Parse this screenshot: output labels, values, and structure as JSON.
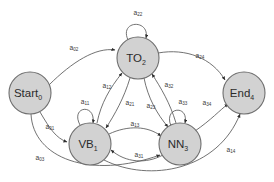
{
  "diagram": {
    "type": "state-transition-diagram",
    "title": "",
    "background_color": "#ffffff",
    "node_fill_color": "#d2d2d2",
    "node_stroke_color": "#6e6e6e",
    "edge_color": "#585858",
    "label_color": "#3a3a3a",
    "nodes": [
      {
        "id": "start",
        "base": "Start",
        "subscript": "0",
        "cx": 30,
        "cy": 93,
        "r": 21
      },
      {
        "id": "to",
        "base": "TO",
        "subscript": "2",
        "cx": 138,
        "cy": 58,
        "r": 21
      },
      {
        "id": "vb",
        "base": "VB",
        "subscript": "1",
        "cx": 90,
        "cy": 144,
        "r": 21
      },
      {
        "id": "nn",
        "base": "NN",
        "subscript": "3",
        "cx": 180,
        "cy": 144,
        "r": 21
      },
      {
        "id": "end",
        "base": "End",
        "subscript": "4",
        "cx": 244,
        "cy": 93,
        "r": 21
      }
    ],
    "edges": [
      {
        "id": "a02",
        "base": "a",
        "subscript": "02",
        "from": "start",
        "to": "to",
        "label_x": 74,
        "label_y": 48
      },
      {
        "id": "a01",
        "base": "a",
        "subscript": "01",
        "from": "start",
        "to": "vb",
        "label_x": 50,
        "label_y": 127
      },
      {
        "id": "a03",
        "base": "a",
        "subscript": "03",
        "from": "start",
        "to": "nn",
        "label_x": 40,
        "label_y": 158
      },
      {
        "id": "a11",
        "base": "a",
        "subscript": "11",
        "from": "vb",
        "to": "vb",
        "label_x": 85,
        "label_y": 102
      },
      {
        "id": "a22",
        "base": "a",
        "subscript": "22",
        "from": "to",
        "to": "to",
        "label_x": 138,
        "label_y": 13
      },
      {
        "id": "a33",
        "base": "a",
        "subscript": "33",
        "from": "nn",
        "to": "nn",
        "label_x": 183,
        "label_y": 102
      },
      {
        "id": "a12",
        "base": "a",
        "subscript": "12",
        "from": "vb",
        "to": "to",
        "label_x": 107,
        "label_y": 86
      },
      {
        "id": "a21",
        "base": "a",
        "subscript": "21",
        "from": "to",
        "to": "vb",
        "label_x": 130,
        "label_y": 103
      },
      {
        "id": "a23",
        "base": "a",
        "subscript": "23",
        "from": "to",
        "to": "nn",
        "label_x": 151,
        "label_y": 106
      },
      {
        "id": "a32",
        "base": "a",
        "subscript": "32",
        "from": "nn",
        "to": "to",
        "label_x": 169,
        "label_y": 85
      },
      {
        "id": "a13",
        "base": "a",
        "subscript": "13",
        "from": "vb",
        "to": "nn",
        "label_x": 135,
        "label_y": 124
      },
      {
        "id": "a31",
        "base": "a",
        "subscript": "31",
        "from": "nn",
        "to": "vb",
        "label_x": 139,
        "label_y": 155
      },
      {
        "id": "a24",
        "base": "a",
        "subscript": "24",
        "from": "to",
        "to": "end",
        "label_x": 200,
        "label_y": 56
      },
      {
        "id": "a34",
        "base": "a",
        "subscript": "34",
        "from": "nn",
        "to": "end",
        "label_x": 207,
        "label_y": 103
      },
      {
        "id": "a14",
        "base": "a",
        "subscript": "14",
        "from": "vb",
        "to": "end",
        "label_x": 231,
        "label_y": 150
      }
    ]
  }
}
